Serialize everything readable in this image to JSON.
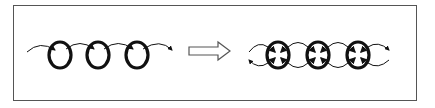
{
  "diagram": {
    "left_panel": {
      "label": "",
      "ring_count": 3,
      "flow": "unidirectional"
    },
    "transition_arrow": {
      "icon": "hollow-right-arrow-icon"
    },
    "right_panel": {
      "label": "",
      "ring_count": 3,
      "flow": "bidirectional"
    },
    "colors": {
      "stroke": "#111111",
      "frame": "#555555",
      "background": "#ffffff"
    }
  }
}
